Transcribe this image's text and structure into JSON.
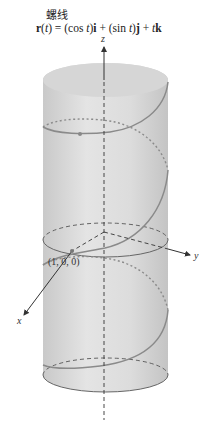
{
  "figure": {
    "title": "螺线",
    "formula": {
      "parts": [
        "r",
        "(",
        "t",
        ") = (cos ",
        "t",
        ")",
        "i",
        " + (sin ",
        "t",
        ")",
        "j",
        " + ",
        "t",
        "k"
      ]
    },
    "axes": {
      "x_label": "x",
      "y_label": "y",
      "z_label": "z"
    },
    "point_label": "(1, 0, 0)",
    "colors": {
      "cylinder_fill": "#d9d9d9",
      "helix": "#8a8a8a",
      "axis": "#333333",
      "dashed": "#555555"
    }
  }
}
